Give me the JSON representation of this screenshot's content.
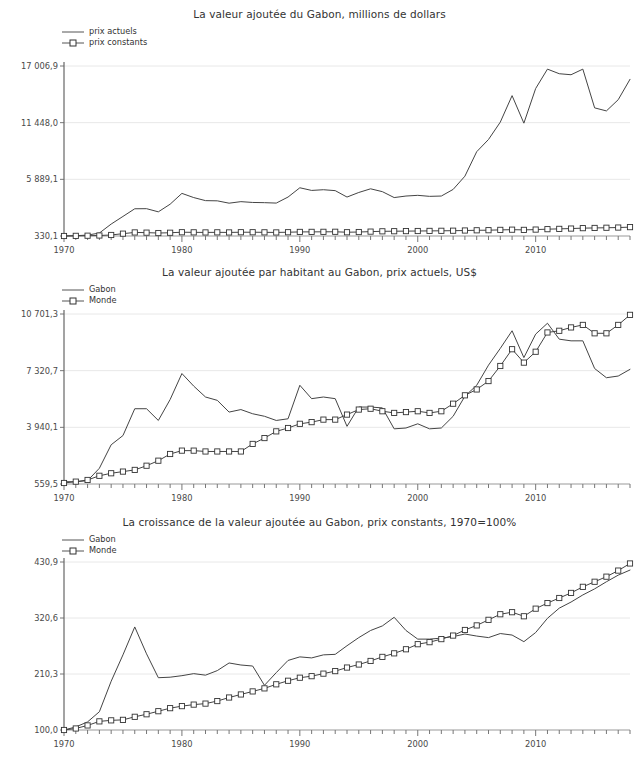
{
  "charts": [
    {
      "id": "chart-0",
      "title": "La valeur ajoutée du Gabon, millions de dollars",
      "legend": [
        {
          "label": "prix actuels",
          "marker": "line"
        },
        {
          "label": "prix constants",
          "marker": "line-square"
        }
      ],
      "chart_data": {
        "type": "line",
        "title": "La valeur ajoutée du Gabon, millions de dollars",
        "xlabel": "",
        "ylabel": "",
        "grid": true,
        "legend_position": "top-left",
        "ytick_labels": [
          "17 006,9",
          "11 448,0",
          "5 889,1",
          "330,1"
        ],
        "ytick_values": [
          17006.9,
          11448.0,
          5889.1,
          330.1
        ],
        "ylim": [
          330.1,
          17006.9
        ],
        "xtick_labels": [
          "1970",
          "1980",
          "1990",
          "2000",
          "2010"
        ],
        "xtick_values": [
          1970,
          1980,
          1990,
          2000,
          2010
        ],
        "xlim": [
          1970,
          2018
        ],
        "x": [
          1970,
          1971,
          1972,
          1973,
          1974,
          1975,
          1976,
          1977,
          1978,
          1979,
          1980,
          1981,
          1982,
          1983,
          1984,
          1985,
          1986,
          1987,
          1988,
          1989,
          1990,
          1991,
          1992,
          1993,
          1994,
          1995,
          1996,
          1997,
          1998,
          1999,
          2000,
          2001,
          2002,
          2003,
          2004,
          2005,
          2006,
          2007,
          2008,
          2009,
          2010,
          2011,
          2012,
          2013,
          2014,
          2015,
          2016,
          2017,
          2018
        ],
        "series": [
          {
            "name": "prix actuels",
            "marker": "none",
            "values": [
              330,
              360,
              420,
              620,
              1500,
              2250,
              3000,
              3010,
              2700,
              3450,
              4510,
              4100,
              3800,
              3780,
              3550,
              3700,
              3620,
              3600,
              3560,
              4150,
              5060,
              4800,
              4870,
              4780,
              4150,
              4600,
              4960,
              4680,
              4100,
              4250,
              4320,
              4220,
              4250,
              4900,
              6200,
              8600,
              9800,
              11500,
              14100,
              11400,
              14800,
              16700,
              16250,
              16150,
              16700,
              12900,
              12600,
              13700,
              15700
            ]
          },
          {
            "name": "prix constants",
            "marker": "square",
            "values": [
              330,
              345,
              360,
              380,
              430,
              560,
              680,
              660,
              620,
              650,
              700,
              690,
              680,
              690,
              680,
              700,
              700,
              690,
              680,
              700,
              730,
              735,
              740,
              745,
              700,
              720,
              760,
              790,
              800,
              810,
              820,
              830,
              840,
              850,
              870,
              890,
              900,
              930,
              950,
              930,
              960,
              1000,
              1030,
              1060,
              1100,
              1120,
              1140,
              1160,
              1200
            ]
          }
        ]
      }
    },
    {
      "id": "chart-1",
      "title": "La valeur ajoutée par habitant au Gabon, prix actuels, US$",
      "legend": [
        {
          "label": "Gabon",
          "marker": "line"
        },
        {
          "label": "Monde",
          "marker": "line-square"
        }
      ],
      "chart_data": {
        "type": "line",
        "title": "La valeur ajoutée par habitant au Gabon, prix actuels, US$",
        "xlabel": "",
        "ylabel": "",
        "grid": true,
        "legend_position": "top-left",
        "ytick_labels": [
          "10 701,3",
          "7 320,7",
          "3 940,1",
          "559,5"
        ],
        "ytick_values": [
          10701.3,
          7320.7,
          3940.1,
          559.5
        ],
        "ylim": [
          559.5,
          10701.3
        ],
        "xtick_labels": [
          "1970",
          "1980",
          "1990",
          "2000",
          "2010"
        ],
        "xtick_values": [
          1970,
          1980,
          1990,
          2000,
          2010
        ],
        "xlim": [
          1970,
          2018
        ],
        "x": [
          1970,
          1971,
          1972,
          1973,
          1974,
          1975,
          1976,
          1977,
          1978,
          1979,
          1980,
          1981,
          1982,
          1983,
          1984,
          1985,
          1986,
          1987,
          1988,
          1989,
          1990,
          1991,
          1992,
          1993,
          1994,
          1995,
          1996,
          1997,
          1998,
          1999,
          2000,
          2001,
          2002,
          2003,
          2004,
          2005,
          2006,
          2007,
          2008,
          2009,
          2010,
          2011,
          2012,
          2013,
          2014,
          2015,
          2016,
          2017,
          2018
        ],
        "series": [
          {
            "name": "Gabon",
            "marker": "none",
            "values": [
              700,
              690,
              760,
              1500,
              2900,
              3450,
              5050,
              5050,
              4350,
              5600,
              7150,
              6400,
              5750,
              5550,
              4850,
              5000,
              4750,
              4600,
              4350,
              4450,
              6450,
              5650,
              5750,
              5650,
              4000,
              5150,
              5150,
              5100,
              3850,
              3900,
              4150,
              3850,
              3900,
              4600,
              5800,
              6450,
              7650,
              8650,
              9700,
              8100,
              9500,
              10150,
              9200,
              9100,
              9100,
              7450,
              6900,
              7000,
              7400
            ]
          },
          {
            "name": "Monde",
            "marker": "square",
            "values": [
              620,
              700,
              800,
              1050,
              1200,
              1300,
              1400,
              1650,
              1950,
              2350,
              2550,
              2550,
              2500,
              2500,
              2500,
              2500,
              2950,
              3300,
              3700,
              3900,
              4150,
              4250,
              4400,
              4400,
              4700,
              5000,
              5050,
              4900,
              4800,
              4850,
              4900,
              4800,
              4900,
              5350,
              5850,
              6200,
              6700,
              7600,
              8600,
              7800,
              8450,
              9600,
              9700,
              9900,
              10050,
              9550,
              9550,
              10050,
              10650
            ]
          }
        ]
      }
    },
    {
      "id": "chart-2",
      "title": "La croissance de la valeur ajoutée au Gabon, prix constants, 1970=100%",
      "legend": [
        {
          "label": "Gabon",
          "marker": "line"
        },
        {
          "label": "Monde",
          "marker": "line-square"
        }
      ],
      "chart_data": {
        "type": "line",
        "title": "La croissance de la valeur ajoutée au Gabon, prix constants, 1970=100%",
        "xlabel": "",
        "ylabel": "",
        "grid": true,
        "legend_position": "top-left",
        "ytick_labels": [
          "430,9",
          "320,6",
          "210,3",
          "100,0"
        ],
        "ytick_values": [
          430.9,
          320.6,
          210.3,
          100.0
        ],
        "ylim": [
          100.0,
          430.9
        ],
        "xtick_labels": [
          "1970",
          "1980",
          "1990",
          "2000",
          "2010"
        ],
        "xtick_values": [
          1970,
          1980,
          1990,
          2000,
          2010
        ],
        "xlim": [
          1970,
          2018
        ],
        "x": [
          1970,
          1971,
          1972,
          1973,
          1974,
          1975,
          1976,
          1977,
          1978,
          1979,
          1980,
          1981,
          1982,
          1983,
          1984,
          1985,
          1986,
          1987,
          1988,
          1989,
          1990,
          1991,
          1992,
          1993,
          1994,
          1995,
          1996,
          1997,
          1998,
          1999,
          2000,
          2001,
          2002,
          2003,
          2004,
          2005,
          2006,
          2007,
          2008,
          2009,
          2010,
          2011,
          2012,
          2013,
          2014,
          2015,
          2016,
          2017,
          2018
        ],
        "series": [
          {
            "name": "Gabon",
            "marker": "none",
            "values": [
              100,
              106,
              116,
              136,
              196,
              248,
              303,
              250,
              203,
              204,
              207,
              211,
              208,
              217,
              232,
              228,
              226,
              188,
              213,
              237,
              244,
              242,
              248,
              249,
              266,
              282,
              296,
              305,
              322,
              296,
              279,
              279,
              281,
              284,
              289,
              285,
              282,
              290,
              287,
              274,
              292,
              320,
              340,
              352,
              366,
              378,
              392,
              405,
              415
            ]
          },
          {
            "name": "Monde",
            "marker": "square",
            "values": [
              100,
              103,
              109,
              117,
              119,
              120,
              126,
              131,
              137,
              143,
              147,
              150,
              152,
              157,
              164,
              170,
              176,
              182,
              190,
              197,
              203,
              206,
              211,
              216,
              223,
              229,
              236,
              244,
              251,
              259,
              269,
              273,
              279,
              286,
              297,
              306,
              317,
              328,
              332,
              324,
              339,
              350,
              360,
              370,
              382,
              392,
              402,
              414,
              428
            ]
          }
        ]
      }
    }
  ]
}
